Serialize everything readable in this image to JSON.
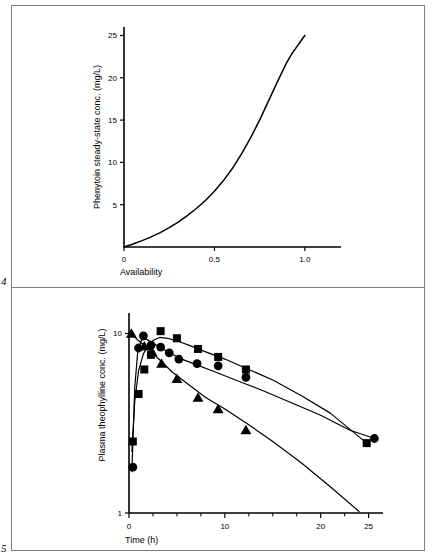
{
  "page": {
    "background": "#ffffff",
    "frame_color": "#808080",
    "ink_color": "#000000"
  },
  "figures": [
    {
      "number": "4",
      "panel": "top"
    },
    {
      "number": "5",
      "panel": "bottom"
    }
  ],
  "chart_data": [
    {
      "type": "line",
      "panel": "top",
      "figure_number": "4",
      "title": "",
      "xlabel": "Availability",
      "ylabel": "Phenytoin steady-state conc. (mg/L)",
      "xlim": [
        0,
        1.2
      ],
      "ylim": [
        0,
        26
      ],
      "xticks": [
        0,
        0.5,
        1.0
      ],
      "xticklabels": [
        "0",
        "0.5",
        "1.0"
      ],
      "yticks": [
        5,
        10,
        15,
        20,
        25
      ],
      "yticklabels": [
        "5",
        "10",
        "15",
        "20",
        "25"
      ],
      "grid": false,
      "legend": "none",
      "scale": {
        "x": "linear",
        "y": "linear"
      },
      "series": [
        {
          "name": "Phenytoin steady-state concentration",
          "marker": "none",
          "line": "solid",
          "x": [
            0.0,
            0.05,
            0.1,
            0.15,
            0.2,
            0.25,
            0.3,
            0.35,
            0.4,
            0.45,
            0.5,
            0.55,
            0.6,
            0.65,
            0.7,
            0.75,
            0.8,
            0.85,
            0.9,
            0.93,
            0.96,
            0.98,
            1.0
          ],
          "y": [
            0.0,
            0.35,
            0.75,
            1.2,
            1.7,
            2.3,
            2.95,
            3.7,
            4.55,
            5.5,
            6.6,
            7.85,
            9.3,
            11.0,
            12.9,
            15.0,
            17.3,
            19.6,
            21.8,
            22.9,
            23.8,
            24.4,
            25.0
          ]
        }
      ]
    },
    {
      "type": "line",
      "panel": "bottom",
      "figure_number": "5",
      "title": "",
      "xlabel": "Time (h)",
      "ylabel": "Plasma theophylline conc. (mg/L)",
      "xlim": [
        0,
        26.5
      ],
      "ylim": [
        1,
        13
      ],
      "xticks": [
        0,
        10,
        20,
        25
      ],
      "xticklabels": [
        "0",
        "10",
        "20",
        "25"
      ],
      "xminorticks": [
        2.5,
        5,
        7.5,
        12.5,
        15,
        17.5,
        22.5
      ],
      "yticks": [
        1,
        10
      ],
      "yticklabels": [
        "1",
        "10"
      ],
      "grid": false,
      "legend": "none",
      "scale": {
        "x": "linear",
        "y": "log"
      },
      "series": [
        {
          "name": "Formulation A",
          "marker": "square",
          "line": "solid",
          "x": [
            0.4,
            1.0,
            1.6,
            2.3,
            3.3,
            5.0,
            7.2,
            9.3,
            12.2,
            24.8
          ],
          "y": [
            2.5,
            4.6,
            6.3,
            7.6,
            10.3,
            9.4,
            8.2,
            7.4,
            6.3,
            2.45
          ],
          "curve_x": [
            0.3,
            0.6,
            1.0,
            1.5,
            2.0,
            2.6,
            3.2,
            4.0,
            5.0,
            6.5,
            8.0,
            10.0,
            12.5,
            15.0,
            18.0,
            21.0,
            24.8
          ],
          "curve_y": [
            2.2,
            4.2,
            6.2,
            7.7,
            8.6,
            9.2,
            9.5,
            9.4,
            9.1,
            8.5,
            7.9,
            7.2,
            6.3,
            5.5,
            4.5,
            3.6,
            2.45
          ]
        },
        {
          "name": "Formulation B",
          "marker": "circle",
          "line": "solid",
          "x": [
            0.4,
            1.0,
            1.5,
            2.3,
            3.3,
            4.2,
            5.2,
            7.1,
            9.3,
            12.2,
            25.6
          ],
          "y": [
            1.8,
            8.3,
            9.7,
            8.6,
            8.4,
            7.8,
            7.2,
            6.8,
            6.6,
            5.7,
            2.6
          ],
          "curve_x": [
            0.3,
            0.6,
            0.9,
            1.3,
            1.8,
            2.4,
            3.2,
            4.2,
            5.5,
            7.0,
            9.0,
            11.5,
            14.0,
            17.0,
            20.0,
            23.0,
            25.6
          ],
          "curve_y": [
            1.7,
            5.0,
            7.8,
            9.2,
            9.3,
            8.9,
            8.4,
            7.8,
            7.2,
            6.7,
            6.1,
            5.4,
            4.8,
            4.1,
            3.5,
            2.9,
            2.6
          ]
        },
        {
          "name": "Formulation C",
          "marker": "triangle",
          "line": "solid",
          "x": [
            0.25,
            1.6,
            2.4,
            3.4,
            5.0,
            7.2,
            9.3,
            12.2
          ],
          "y": [
            10.0,
            8.5,
            7.9,
            6.8,
            5.6,
            4.4,
            3.8,
            2.9
          ],
          "curve_x": [
            0.25,
            1.0,
            2.0,
            3.0,
            4.5,
            6.0,
            8.0,
            10.0,
            12.5,
            15.0,
            18.0,
            21.0,
            24.0
          ],
          "curve_y": [
            10.0,
            9.1,
            8.3,
            7.3,
            6.1,
            5.3,
            4.4,
            3.8,
            3.1,
            2.5,
            1.9,
            1.4,
            1.02
          ]
        }
      ]
    }
  ]
}
